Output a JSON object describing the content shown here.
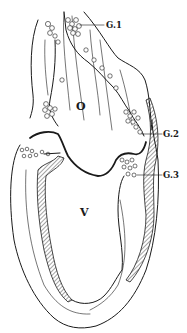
{
  "figure": {
    "labels": {
      "atrium": "O",
      "ventricle": "V",
      "ganglion_1": "G.1",
      "ganglion_2": "G.2",
      "ganglion_3": "G.3"
    },
    "colors": {
      "ink": "#1a1a1a",
      "background": "#ffffff"
    }
  }
}
